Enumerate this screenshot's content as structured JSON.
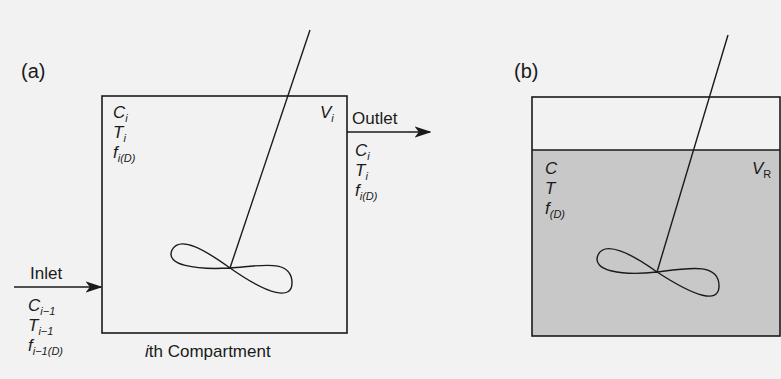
{
  "figure": {
    "panel_a": {
      "label": "(a)",
      "caption_i": "i",
      "caption_rest": "th Compartment",
      "volume": {
        "base": "V",
        "sub": "i"
      },
      "inside": [
        {
          "base": "C",
          "sub": "i"
        },
        {
          "base": "T",
          "sub": "i"
        },
        {
          "base": "f",
          "sub": "i(D)"
        }
      ],
      "outlet": {
        "label": "Outlet",
        "vars": [
          {
            "base": "C",
            "sub": "i"
          },
          {
            "base": "T",
            "sub": "i"
          },
          {
            "base": "f",
            "sub": "i(D)"
          }
        ]
      },
      "inlet": {
        "label": "Inlet",
        "vars": [
          {
            "base": "C",
            "sub": "i−1"
          },
          {
            "base": "T",
            "sub": "i−1"
          },
          {
            "base": "f",
            "sub": "i−1(D)"
          }
        ]
      }
    },
    "panel_b": {
      "label": "(b)",
      "volume": {
        "base": "V",
        "sub": "R"
      },
      "inside": [
        {
          "base": "C",
          "sub": ""
        },
        {
          "base": "T",
          "sub": ""
        },
        {
          "base": "f",
          "sub": "(D)"
        }
      ],
      "liquid_fill": "#c8c8c8"
    },
    "colors": {
      "line": "#1a1a1a",
      "background": "#f2f2f2"
    }
  }
}
